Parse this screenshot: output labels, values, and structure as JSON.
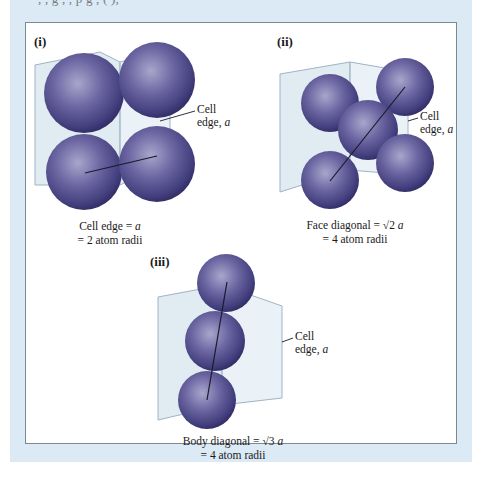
{
  "figure": {
    "top_text_clipped": "      ,  ,      g   ,   ,  p  g    ,  ( ),",
    "colors": {
      "background_outer": "#dbeaf5",
      "panel_background": "#ffffff",
      "panel_border": "#7a8a92",
      "atom_fill": "#5c5792",
      "atom_highlight": "#a9a6cc",
      "atom_shadow": "#2f2b62",
      "cube_fill": "#c9dbe8",
      "cube_edge": "#9fb4c4",
      "diagonal_line": "#1a1a2a"
    },
    "panels": [
      {
        "id": "i",
        "label": "(i)",
        "edge_label_line1": "Cell",
        "edge_label_line2": "edge, ",
        "edge_label_var": "a",
        "caption_line1_prefix": "Cell edge = ",
        "caption_line1_var": "a",
        "caption_line2": "= 2 atom radii"
      },
      {
        "id": "ii",
        "label": "(ii)",
        "edge_label_line1": "Cell",
        "edge_label_line2": "edge, ",
        "edge_label_var": "a",
        "caption_line1_prefix": "Face diagonal = √2 ",
        "caption_line1_var": "a",
        "caption_line2": "= 4 atom radii"
      },
      {
        "id": "iii",
        "label": "(iii)",
        "edge_label_line1": "Cell",
        "edge_label_line2": "edge, ",
        "edge_label_var": "a",
        "caption_line1_prefix": "Body diagonal = √3 ",
        "caption_line1_var": "a",
        "caption_line2": "= 4 atom radii"
      }
    ]
  }
}
